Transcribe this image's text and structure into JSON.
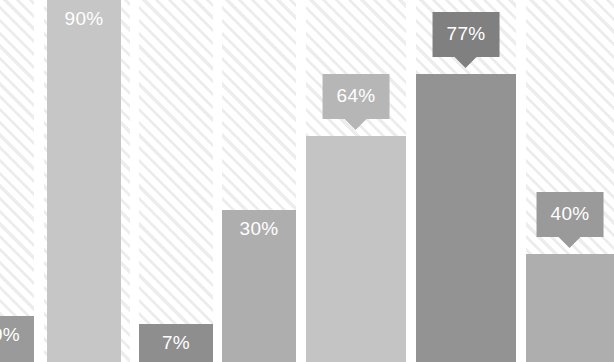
{
  "chart_data": {
    "type": "bar",
    "title": "",
    "subtitle": "",
    "xlabel": "",
    "ylabel": "",
    "ylim": [
      0,
      100
    ],
    "grid": false,
    "legend": null,
    "value_suffix": "%",
    "categories": [
      "",
      "",
      "",
      "",
      "",
      "",
      ""
    ],
    "values": [
      9,
      90,
      7,
      30,
      64,
      77,
      40
    ],
    "labels": [
      "9%",
      "90%",
      "7%",
      "30%",
      "64%",
      "77%",
      "40%"
    ],
    "bars": [
      {
        "label": "9%",
        "value": 9,
        "color": "#9a9a9a",
        "label_style": "inline",
        "clipped_left": true,
        "left_px": -22,
        "width_px": 56,
        "height_px": 46
      },
      {
        "label": "90%",
        "value": 90,
        "color": "#c6c6c6",
        "label_style": "inline",
        "clipped_left": false,
        "left_px": 47,
        "width_px": 74,
        "height_px": 362
      },
      {
        "label": "7%",
        "value": 7,
        "color": "#8e8e8e",
        "label_style": "inline",
        "clipped_left": false,
        "left_px": 139,
        "width_px": 74,
        "height_px": 38
      },
      {
        "label": "30%",
        "value": 30,
        "color": "#aeaeae",
        "label_style": "inline",
        "clipped_left": false,
        "left_px": 222,
        "width_px": 74,
        "height_px": 152
      },
      {
        "label": "64%",
        "value": 64,
        "color": "#c4c4c4",
        "label_style": "callout",
        "callout_color": "#b6b6b6",
        "clipped_left": false,
        "left_px": 306,
        "width_px": 100,
        "height_px": 226
      },
      {
        "label": "77%",
        "value": 77,
        "color": "#939393",
        "label_style": "callout",
        "callout_color": "#808080",
        "clipped_left": false,
        "left_px": 416,
        "width_px": 100,
        "height_px": 288
      },
      {
        "label": "40%",
        "value": 40,
        "color": "#aeaeae",
        "label_style": "callout",
        "callout_color": "#9a9a9a",
        "clipped_left": false,
        "left_px": 526,
        "width_px": 88,
        "height_px": 108
      }
    ],
    "columns": [
      {
        "left_px": 0,
        "width_px": 34
      },
      {
        "left_px": 44,
        "width_px": 86
      },
      {
        "left_px": 139,
        "width_px": 74
      },
      {
        "left_px": 222,
        "width_px": 74
      },
      {
        "left_px": 306,
        "width_px": 100
      },
      {
        "left_px": 416,
        "width_px": 100
      },
      {
        "left_px": 526,
        "width_px": 88
      }
    ]
  },
  "theme": {
    "background": "#ffffff",
    "hatch_color": "#ededed",
    "label_text_color": "#ffffff"
  }
}
